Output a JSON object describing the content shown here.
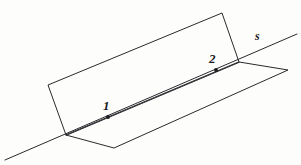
{
  "figure": {
    "background_color": "#fdfdfc",
    "ink_color": "#2a2a2e",
    "labels": {
      "point_1": "1",
      "point_2": "2",
      "line_s": "s"
    },
    "points": [
      {
        "name": "point-1",
        "label": "1",
        "x": 108,
        "y": 117
      },
      {
        "name": "point-2",
        "label": "2",
        "x": 216,
        "y": 70
      }
    ],
    "lines": [
      {
        "name": "line-s",
        "label": "s",
        "description": "line of intersection of the two planes",
        "from": {
          "x": 5,
          "y": 160
        },
        "to": {
          "x": 297,
          "y": 34
        }
      }
    ],
    "planes": [
      {
        "name": "vertical-plane",
        "description": "upper slanted plane standing on line s",
        "vertices": [
          {
            "x": 66,
            "y": 135
          },
          {
            "x": 48,
            "y": 85
          },
          {
            "x": 222,
            "y": 13
          },
          {
            "x": 239,
            "y": 62
          }
        ]
      },
      {
        "name": "horizontal-plane",
        "description": "lower plane lying along line s",
        "vertices": [
          {
            "x": 66,
            "y": 135
          },
          {
            "x": 114,
            "y": 148
          },
          {
            "x": 288,
            "y": 70
          },
          {
            "x": 239,
            "y": 62
          }
        ]
      }
    ]
  }
}
